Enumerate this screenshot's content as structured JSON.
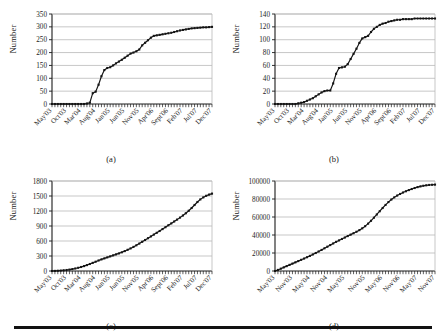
{
  "figure": {
    "bottom_rule": true,
    "axis_color": "#1a1a1a",
    "grid_color": "#b9b9b9",
    "series_color": "#141414",
    "background": "#ffffff"
  },
  "panels": [
    {
      "id": "a",
      "caption": "(a)",
      "ylabel": "Number"
    },
    {
      "id": "b",
      "caption": "(b)",
      "ylabel": "Number"
    },
    {
      "id": "c",
      "caption": "(c)",
      "ylabel": "Number"
    },
    {
      "id": "d",
      "caption": "(d)",
      "ylabel": "Number"
    }
  ],
  "chart_data": [
    {
      "type": "line",
      "panel": "a",
      "title": "(a)",
      "xlabel": "",
      "ylabel": "Number",
      "ylim": [
        0,
        350
      ],
      "yticks": [
        0,
        50,
        100,
        150,
        200,
        250,
        300,
        350
      ],
      "xtick_labels": [
        "May'03",
        "Oct'03",
        "Mar'04",
        "Aug'04",
        "Jan'05",
        "Jun'05",
        "Nov'05",
        "Apr'06",
        "Sept'06",
        "Feb'07",
        "Jul'07",
        "Dec'07"
      ],
      "grid": true,
      "legend": "none",
      "marker": "square",
      "x": [
        "May'03",
        "Jun'03",
        "Jul'03",
        "Aug'03",
        "Sep'03",
        "Oct'03",
        "Nov'03",
        "Dec'03",
        "Jan'04",
        "Feb'04",
        "Mar'04",
        "Apr'04",
        "May'04",
        "Jun'04",
        "Jul'04",
        "Aug'04",
        "Sep'04",
        "Oct'04",
        "Nov'04",
        "Dec'04",
        "Jan'05",
        "Feb'05",
        "Mar'05",
        "Apr'05",
        "May'05",
        "Jun'05",
        "Jul'05",
        "Aug'05",
        "Sep'05",
        "Oct'05",
        "Nov'05",
        "Dec'05",
        "Jan'06",
        "Feb'06",
        "Mar'06",
        "Apr'06",
        "May'06",
        "Jun'06",
        "Jul'06",
        "Aug'06",
        "Sep'06",
        "Oct'06",
        "Nov'06",
        "Dec'06",
        "Jan'07",
        "Feb'07",
        "Mar'07",
        "Apr'07",
        "May'07",
        "Jun'07",
        "Jul'07",
        "Aug'07",
        "Sep'07",
        "Oct'07",
        "Nov'07",
        "Dec'07"
      ],
      "values": [
        0,
        0,
        0,
        0,
        0,
        0,
        0,
        0,
        0,
        0,
        0,
        0,
        2,
        5,
        42,
        48,
        75,
        108,
        132,
        140,
        143,
        150,
        158,
        165,
        172,
        180,
        188,
        196,
        200,
        205,
        212,
        228,
        238,
        248,
        258,
        265,
        267,
        269,
        271,
        273,
        275,
        277,
        280,
        283,
        286,
        288,
        290,
        292,
        294,
        295,
        296,
        297,
        298,
        298,
        299,
        300
      ]
    },
    {
      "type": "line",
      "panel": "b",
      "title": "(b)",
      "xlabel": "",
      "ylabel": "Number",
      "ylim": [
        0,
        140
      ],
      "yticks": [
        0,
        20,
        40,
        60,
        80,
        100,
        120,
        140
      ],
      "xtick_labels": [
        "May'03",
        "Oct'03",
        "Mar'04",
        "Aug'04",
        "Jan'05",
        "Jun'05",
        "Nov'05",
        "Apr'06",
        "Sept'06",
        "Feb'07",
        "Jul'07",
        "Dec'07"
      ],
      "grid": true,
      "legend": "none",
      "marker": "square",
      "x": [
        "May'03",
        "Jun'03",
        "Jul'03",
        "Aug'03",
        "Sep'03",
        "Oct'03",
        "Nov'03",
        "Dec'03",
        "Jan'04",
        "Feb'04",
        "Mar'04",
        "Apr'04",
        "May'04",
        "Jun'04",
        "Jul'04",
        "Aug'04",
        "Sep'04",
        "Oct'04",
        "Nov'04",
        "Dec'04",
        "Jan'05",
        "Feb'05",
        "Mar'05",
        "Apr'05",
        "May'05",
        "Jun'05",
        "Jul'05",
        "Aug'05",
        "Sep'05",
        "Oct'05",
        "Nov'05",
        "Dec'05",
        "Jan'06",
        "Feb'06",
        "Mar'06",
        "Apr'06",
        "May'06",
        "Jun'06",
        "Jul'06",
        "Aug'06",
        "Sep'06",
        "Oct'06",
        "Nov'06",
        "Dec'06",
        "Jan'07",
        "Feb'07",
        "Mar'07",
        "Apr'07",
        "May'07",
        "Jun'07",
        "Jul'07",
        "Aug'07",
        "Sep'07",
        "Oct'07",
        "Nov'07",
        "Dec'07"
      ],
      "values": [
        0,
        0,
        0,
        0,
        0,
        0,
        0,
        0,
        1,
        2,
        3,
        5,
        7,
        9,
        12,
        15,
        18,
        20,
        21,
        21,
        32,
        47,
        56,
        57,
        58,
        62,
        70,
        78,
        86,
        95,
        102,
        104,
        106,
        112,
        117,
        120,
        123,
        125,
        126,
        128,
        129,
        130,
        131,
        131,
        132,
        132,
        132,
        132,
        133,
        133,
        133,
        133,
        133,
        133,
        133,
        133
      ]
    },
    {
      "type": "line",
      "panel": "c",
      "title": "(c)",
      "xlabel": "",
      "ylabel": "Number",
      "ylim": [
        0,
        1800
      ],
      "yticks": [
        0,
        300,
        600,
        900,
        1200,
        1500,
        1800
      ],
      "xtick_labels": [
        "May'03",
        "Oct'03",
        "Mar'04",
        "Aug'04",
        "Jan'05",
        "Jun'05",
        "Nov'05",
        "Apr'06",
        "Sept'06",
        "Feb'07",
        "Jul'07",
        "Dec'07"
      ],
      "grid": true,
      "legend": "none",
      "marker": "square",
      "x": [
        "May'03",
        "Jun'03",
        "Jul'03",
        "Aug'03",
        "Sep'03",
        "Oct'03",
        "Nov'03",
        "Dec'03",
        "Jan'04",
        "Feb'04",
        "Mar'04",
        "Apr'04",
        "May'04",
        "Jun'04",
        "Jul'04",
        "Aug'04",
        "Sep'04",
        "Oct'04",
        "Nov'04",
        "Dec'04",
        "Jan'05",
        "Feb'05",
        "Mar'05",
        "Apr'05",
        "May'05",
        "Jun'05",
        "Jul'05",
        "Aug'05",
        "Sep'05",
        "Oct'05",
        "Nov'05",
        "Dec'05",
        "Jan'06",
        "Feb'06",
        "Mar'06",
        "Apr'06",
        "May'06",
        "Jun'06",
        "Jul'06",
        "Aug'06",
        "Sep'06",
        "Oct'06",
        "Nov'06",
        "Dec'06",
        "Jan'07",
        "Feb'07",
        "Mar'07",
        "Apr'07",
        "May'07",
        "Jun'07",
        "Jul'07",
        "Aug'07",
        "Sep'07",
        "Oct'07",
        "Nov'07",
        "Dec'07"
      ],
      "values": [
        0,
        2,
        5,
        9,
        14,
        20,
        28,
        38,
        50,
        64,
        80,
        98,
        118,
        140,
        163,
        186,
        210,
        232,
        252,
        272,
        292,
        312,
        332,
        352,
        374,
        398,
        424,
        452,
        482,
        514,
        548,
        584,
        620,
        656,
        692,
        728,
        764,
        800,
        838,
        876,
        914,
        952,
        990,
        1028,
        1068,
        1110,
        1155,
        1205,
        1260,
        1320,
        1380,
        1432,
        1472,
        1504,
        1528,
        1548
      ]
    },
    {
      "type": "line",
      "panel": "d",
      "title": "(d)",
      "xlabel": "",
      "ylabel": "Number",
      "ylim": [
        0,
        100000
      ],
      "yticks": [
        0,
        20000,
        40000,
        60000,
        80000,
        100000
      ],
      "xtick_labels": [
        "May'03",
        "Nov'03",
        "May'04",
        "Nov'04",
        "May'05",
        "Nov'05",
        "May'06",
        "Nov'06",
        "May'07",
        "Nov'07"
      ],
      "grid": true,
      "legend": "none",
      "marker": "square",
      "x": [
        "May'03",
        "Jun'03",
        "Jul'03",
        "Aug'03",
        "Sep'03",
        "Oct'03",
        "Nov'03",
        "Dec'03",
        "Jan'04",
        "Feb'04",
        "Mar'04",
        "Apr'04",
        "May'04",
        "Jun'04",
        "Jul'04",
        "Aug'04",
        "Sep'04",
        "Oct'04",
        "Nov'04",
        "Dec'04",
        "Jan'05",
        "Feb'05",
        "Mar'05",
        "Apr'05",
        "May'05",
        "Jun'05",
        "Jul'05",
        "Aug'05",
        "Sep'05",
        "Oct'05",
        "Nov'05",
        "Dec'05",
        "Jan'06",
        "Feb'06",
        "Mar'06",
        "Apr'06",
        "May'06",
        "Jun'06",
        "Jul'06",
        "Aug'06",
        "Sep'06",
        "Oct'06",
        "Nov'06",
        "Dec'06",
        "Jan'07",
        "Feb'07",
        "Mar'07",
        "Apr'07",
        "May'07",
        "Jun'07",
        "Jul'07",
        "Aug'07",
        "Sep'07",
        "Oct'07",
        "Nov'07",
        "Dec'07"
      ],
      "values": [
        0,
        1200,
        2600,
        4000,
        5400,
        6800,
        8200,
        9600,
        11000,
        12400,
        13800,
        15300,
        16800,
        18400,
        20000,
        21700,
        23400,
        25200,
        27000,
        28800,
        30600,
        32400,
        34000,
        35600,
        37200,
        38800,
        40400,
        42000,
        43600,
        45400,
        47400,
        49800,
        52600,
        55800,
        59200,
        62800,
        66400,
        70000,
        73400,
        76600,
        79400,
        81800,
        83800,
        85600,
        87200,
        88600,
        89900,
        91100,
        92200,
        93200,
        94000,
        94700,
        95200,
        95600,
        95800,
        96000
      ]
    }
  ]
}
